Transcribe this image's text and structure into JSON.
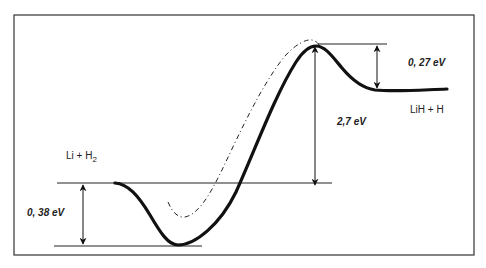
{
  "diagram": {
    "type": "potential-energy-profile",
    "reactants_label": "Li + H",
    "reactants_subscript": "2",
    "products_label": "LiH + H",
    "annotations": {
      "well_depth": "0, 38 eV",
      "barrier_height": "2,7 eV",
      "reverse_barrier": "0, 27 eV"
    },
    "colors": {
      "frame": "#333333",
      "curve": "#111111",
      "lines": "#222222",
      "background": "#ffffff"
    }
  }
}
